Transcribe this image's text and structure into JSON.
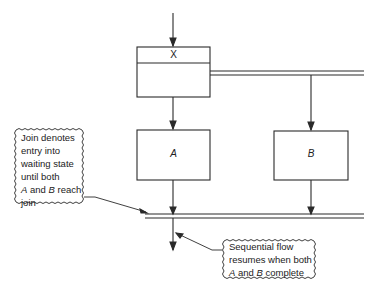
{
  "diagram": {
    "type": "fork-join flow",
    "boxes": {
      "x": {
        "label": "X"
      },
      "a": {
        "label": "A"
      },
      "b": {
        "label": "B"
      }
    },
    "notes": {
      "join": {
        "lines": [
          "Join denotes",
          "entry into",
          "waiting state",
          "until both"
        ],
        "line5_a": "A",
        "line5_mid": " and ",
        "line5_b": "B",
        "line5_end": " reach",
        "line6": "join"
      },
      "resume": {
        "line1": "Sequential flow",
        "line2": "resumes when both",
        "line3_a": "A",
        "line3_mid": " and ",
        "line3_b": "B",
        "line3_end": " complete"
      }
    },
    "colors": {
      "line": "#2a2a2a",
      "background": "#ffffff"
    }
  }
}
